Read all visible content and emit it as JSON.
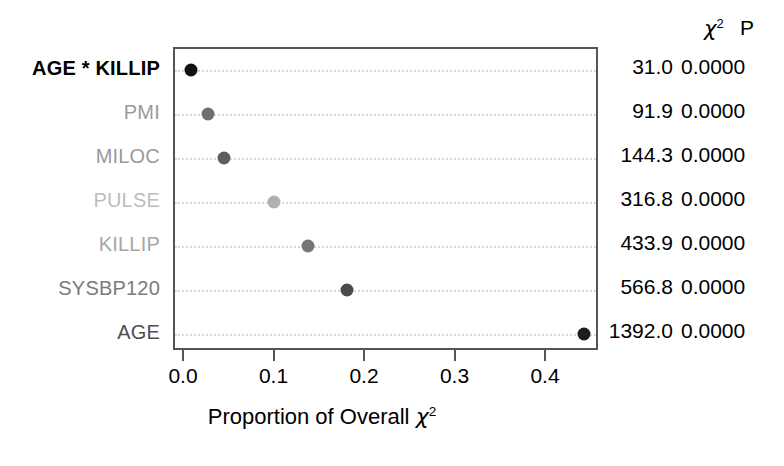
{
  "chart_data": {
    "type": "scatter",
    "title": "",
    "xlabel": "Proportion of Overall χ²",
    "ylabel": "",
    "xlim": [
      0.0,
      0.47
    ],
    "xticks": [
      0.0,
      0.1,
      0.2,
      0.3,
      0.4
    ],
    "xticklabels": [
      "0.0",
      "0.1",
      "0.2",
      "0.3",
      "0.4"
    ],
    "grid": "horizontal dotted",
    "legend": "none",
    "categories": [
      "AGE * KILLIP",
      "PMI",
      "MILOC",
      "PULSE",
      "KILLIP",
      "SYSBP120",
      "AGE"
    ],
    "values": [
      0.007,
      0.025,
      0.043,
      0.098,
      0.136,
      0.179,
      0.441
    ],
    "points": [
      {
        "label": "AGE * KILLIP",
        "proportion": 0.007,
        "chi2": "31.0",
        "p": "0.0000",
        "label_color": "#000000",
        "dot_color": "#111111"
      },
      {
        "label": "PMI",
        "proportion": 0.025,
        "chi2": "91.9",
        "p": "0.0000",
        "label_color": "#9a9a9a",
        "dot_color": "#6e6e6e"
      },
      {
        "label": "MILOC",
        "proportion": 0.043,
        "chi2": "144.3",
        "p": "0.0000",
        "label_color": "#9a9a9a",
        "dot_color": "#5d5d5d"
      },
      {
        "label": "PULSE",
        "proportion": 0.098,
        "chi2": "316.8",
        "p": "0.0000",
        "label_color": "#bcbcbc",
        "dot_color": "#b0b0b0"
      },
      {
        "label": "KILLIP",
        "proportion": 0.136,
        "chi2": "433.9",
        "p": "0.0000",
        "label_color": "#a6a6a6",
        "dot_color": "#767676"
      },
      {
        "label": "SYSBP120",
        "proportion": 0.179,
        "chi2": "566.8",
        "p": "0.0000",
        "label_color": "#7b7b7b",
        "dot_color": "#4a4a4a"
      },
      {
        "label": "AGE",
        "proportion": 0.441,
        "chi2": "1392.0",
        "p": "0.0000",
        "label_color": "#4f4f4f",
        "dot_color": "#1c1c1c"
      }
    ]
  },
  "axis": {
    "x_title_prefix": "Proportion of Overall ",
    "x_title_symbol": "χ",
    "x_title_superscript": "2",
    "tick_labels": [
      "0.0",
      "0.1",
      "0.2",
      "0.3",
      "0.4"
    ]
  },
  "stats_table": {
    "header_chi_symbol": "χ",
    "header_chi_superscript": "2",
    "header_p": "P",
    "rows": [
      {
        "chi2": "31.0",
        "p": "0.0000"
      },
      {
        "chi2": "91.9",
        "p": "0.0000"
      },
      {
        "chi2": "144.3",
        "p": "0.0000"
      },
      {
        "chi2": "316.8",
        "p": "0.0000"
      },
      {
        "chi2": "433.9",
        "p": "0.0000"
      },
      {
        "chi2": "566.8",
        "p": "0.0000"
      },
      {
        "chi2": "1392.0",
        "p": "0.0000"
      }
    ]
  },
  "style": {
    "frame_color": "#555555",
    "grid_color": "#d8d8d8",
    "background": "#ffffff"
  }
}
